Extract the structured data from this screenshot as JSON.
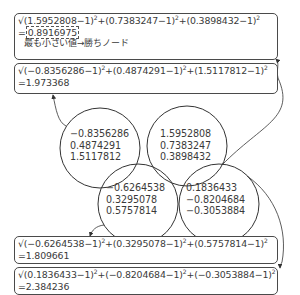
{
  "nodes": [
    {
      "id": "node-1",
      "values": [
        "−0.8356286",
        "0.4874291",
        "1.5117812"
      ]
    },
    {
      "id": "node-2",
      "values": [
        "1.5952808",
        "0.7383247",
        "0.3898432"
      ]
    },
    {
      "id": "node-3",
      "values": [
        "−0.6264538",
        "0.3295078",
        "0.5757814"
      ]
    },
    {
      "id": "node-4",
      "values": [
        "0.1836433",
        "−0.8204684",
        "−0.3053884"
      ]
    }
  ],
  "distances": [
    {
      "terms": [
        "1.5952808",
        "0.7383247",
        "0.3898432"
      ],
      "result": "0.8916975",
      "highlighted": true,
      "note": "最も小さい値→勝ちノード"
    },
    {
      "terms": [
        "−0.8356286",
        "0.4874291",
        "1.5117812"
      ],
      "result": "1.973368"
    },
    {
      "terms": [
        "−0.6264538",
        "0.3295078",
        "0.5757814"
      ],
      "result": "1.809661"
    },
    {
      "terms": [
        "0.1836433",
        "−0.8204684",
        "−0.3053884"
      ],
      "result": "2.384236"
    }
  ],
  "symbols": {
    "sqrt": "√",
    "minus_one": "−1)",
    "open": "(",
    "plus": "+",
    "equals": "=",
    "square": "2"
  }
}
